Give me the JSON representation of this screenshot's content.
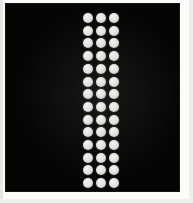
{
  "image": {
    "width": 193,
    "height": 203,
    "background_color": "#fbfbfa",
    "field_color": "#050505",
    "dot_color": "#e2e2df",
    "description": "Black rectangular field containing a vertical array of light gray circular dots arranged in 3 columns and 14 rows"
  },
  "field": {
    "left": 6,
    "top": 4,
    "width": 173,
    "height": 187
  },
  "dot_array": {
    "columns": 3,
    "rows": 14,
    "total_dots": 42,
    "dot_diameter": 10,
    "column_centers_x": [
      88,
      101,
      114
    ],
    "row_start_y": 18,
    "row_spacing_y": 12.7,
    "first_row_center_y": 18,
    "last_row_center_y": 183
  },
  "labels": {
    "field_label": "dark-field",
    "array_label": "dot-grid"
  }
}
